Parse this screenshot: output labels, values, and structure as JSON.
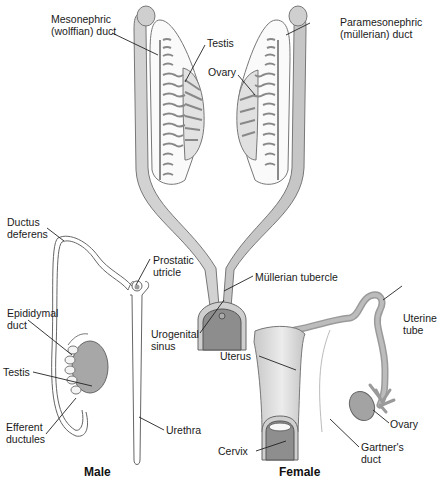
{
  "diagram": {
    "type": "anatomical",
    "labels": {
      "mesonephric": "Mesonephric\n(wolffian) duct",
      "testis_top": "Testis",
      "ovary_top": "Ovary",
      "paramesonephric": "Paramesonephric\n(müllerian) duct",
      "ductus_deferens": "Ductus\ndeferens",
      "prostatic_utricle": "Prostatic\nutricle",
      "mullerian_tubercle": "Müllerian tubercle",
      "urogenital_sinus": "Urogenital\nsinus",
      "epididymal_duct": "Epididymal\nduct",
      "testis_bottom": "Testis",
      "efferent_ductules": "Efferent\nductules",
      "urethra": "Urethra",
      "uterine_tube": "Uterine\ntube",
      "uterus": "Uterus",
      "ovary_bottom": "Ovary",
      "cervix": "Cervix",
      "gartners_duct": "Gartner's\nduct"
    },
    "panel_titles": {
      "male": "Male",
      "female": "Female"
    },
    "colors": {
      "duct_fill": "#cfcfcf",
      "duct_stroke": "#6e6e6e",
      "gonad_fill": "#a9a9a9",
      "sinus_fill": "#8a8a8a",
      "outline": "#555555",
      "background": "#ffffff"
    }
  }
}
